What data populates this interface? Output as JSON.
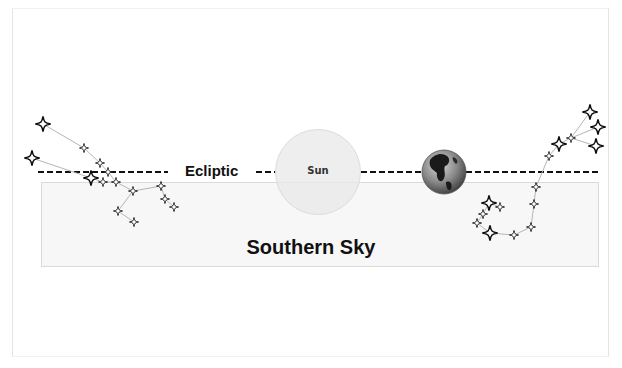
{
  "diagram": {
    "ecliptic_label": "Ecliptic",
    "sun_label": "Sun",
    "sky_label": "Southern Sky",
    "earth_icon": "earth-globe-icon",
    "star_icon": "four-point-star-icon",
    "colors": {
      "ecliptic_line": "#111111",
      "sky_band": "#f7f7f7",
      "sun_fill": "#e8e8e8",
      "constellation_line": "#b0b0b0",
      "star_outline": "#111111"
    }
  },
  "constellations": {
    "left": {
      "stars": [
        {
          "x": 43,
          "y": 124,
          "size": "large"
        },
        {
          "x": 84,
          "y": 148,
          "size": "small"
        },
        {
          "x": 32,
          "y": 158,
          "size": "large"
        },
        {
          "x": 100,
          "y": 163,
          "size": "small"
        },
        {
          "x": 108,
          "y": 172,
          "size": "small"
        },
        {
          "x": 91,
          "y": 178,
          "size": "large"
        },
        {
          "x": 103,
          "y": 182,
          "size": "small"
        },
        {
          "x": 116,
          "y": 182,
          "size": "small"
        },
        {
          "x": 133,
          "y": 191,
          "size": "small"
        },
        {
          "x": 161,
          "y": 186,
          "size": "small"
        },
        {
          "x": 165,
          "y": 199,
          "size": "small"
        },
        {
          "x": 174,
          "y": 207,
          "size": "small"
        },
        {
          "x": 118,
          "y": 211,
          "size": "small"
        },
        {
          "x": 134,
          "y": 222,
          "size": "small"
        }
      ]
    },
    "right": {
      "stars": [
        {
          "x": 590,
          "y": 112,
          "size": "large"
        },
        {
          "x": 598,
          "y": 127,
          "size": "large"
        },
        {
          "x": 596,
          "y": 146,
          "size": "large"
        },
        {
          "x": 571,
          "y": 138,
          "size": "small"
        },
        {
          "x": 559,
          "y": 144,
          "size": "large"
        },
        {
          "x": 549,
          "y": 156,
          "size": "small"
        },
        {
          "x": 536,
          "y": 187,
          "size": "small"
        },
        {
          "x": 534,
          "y": 204,
          "size": "small"
        },
        {
          "x": 531,
          "y": 227,
          "size": "small"
        },
        {
          "x": 514,
          "y": 235,
          "size": "small"
        },
        {
          "x": 490,
          "y": 233,
          "size": "large"
        },
        {
          "x": 477,
          "y": 223,
          "size": "small"
        },
        {
          "x": 483,
          "y": 214,
          "size": "small"
        },
        {
          "x": 489,
          "y": 203,
          "size": "large"
        },
        {
          "x": 500,
          "y": 207,
          "size": "small"
        }
      ]
    }
  }
}
